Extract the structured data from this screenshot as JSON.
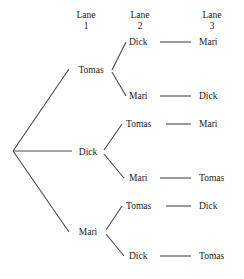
{
  "figure": {
    "type": "tree-diagram",
    "headers": [
      {
        "word": "Lane",
        "number": "1"
      },
      {
        "word": "Lane",
        "number": "2"
      },
      {
        "word": "Lane",
        "number": "3"
      }
    ],
    "lane1": [
      {
        "label": "Tomas"
      },
      {
        "label": "Dick"
      },
      {
        "label": "Mari"
      }
    ],
    "lane2": [
      {
        "label": "Dick"
      },
      {
        "label": "Mari"
      },
      {
        "label": "Tomas"
      },
      {
        "label": "Mari"
      },
      {
        "label": "Tomas"
      },
      {
        "label": "Dick"
      }
    ],
    "lane3": [
      {
        "label": "Mari"
      },
      {
        "label": "Dick"
      },
      {
        "label": "Mari"
      },
      {
        "label": "Tomas"
      },
      {
        "label": "Dick"
      },
      {
        "label": "Tomas"
      }
    ],
    "paths": [
      [
        "Tomas",
        "Dick",
        "Mari"
      ],
      [
        "Tomas",
        "Mari",
        "Dick"
      ],
      [
        "Dick",
        "Tomas",
        "Mari"
      ],
      [
        "Dick",
        "Mari",
        "Tomas"
      ],
      [
        "Mari",
        "Tomas",
        "Dick"
      ],
      [
        "Mari",
        "Dick",
        "Tomas"
      ]
    ],
    "colors": {
      "line": "#4a4a4a",
      "text": "#1a1a1a",
      "background": "#ffffff"
    }
  }
}
